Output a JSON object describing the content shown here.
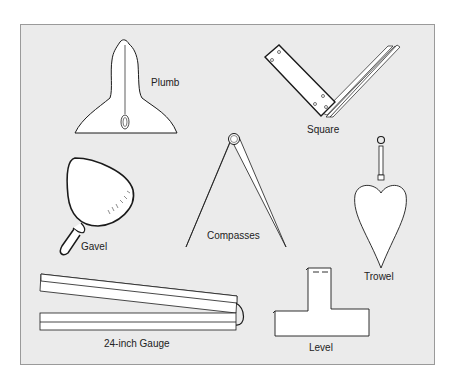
{
  "diagram": {
    "tools": [
      {
        "id": "plumb",
        "label": "Plumb"
      },
      {
        "id": "square",
        "label": "Square"
      },
      {
        "id": "gavel",
        "label": "Gavel"
      },
      {
        "id": "compasses",
        "label": "Compasses"
      },
      {
        "id": "trowel",
        "label": "Trowel"
      },
      {
        "id": "gauge",
        "label": "24-inch Gauge"
      },
      {
        "id": "level",
        "label": "Level"
      }
    ]
  },
  "colors": {
    "panel": "#ebebeb",
    "stroke": "#1a1a1a",
    "fill": "#ffffff"
  }
}
